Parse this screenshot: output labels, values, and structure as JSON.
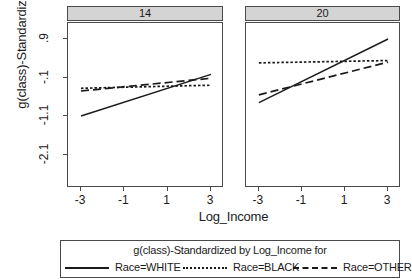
{
  "axes": {
    "ylabel": "g(class)-Standardized",
    "xlabel": "Log_Income",
    "yticks": [
      ".9",
      "-.1",
      "-1.1",
      "-2.1"
    ],
    "ytick_values": [
      0.9,
      -0.1,
      -1.1,
      -2.1
    ],
    "xticks": [
      "-3",
      "-1",
      "1",
      "3"
    ],
    "xtick_values": [
      -3,
      -1,
      1,
      3
    ]
  },
  "panels": [
    {
      "header": "14"
    },
    {
      "header": "20"
    }
  ],
  "legend": {
    "title": "g(class)-Standardized by Log_Income for",
    "entries": [
      {
        "label": "Race=WHITE",
        "style": "solid"
      },
      {
        "label": "Race=BLACK",
        "style": "dotted"
      },
      {
        "label": "Race=OTHER",
        "style": "dashed"
      }
    ]
  },
  "colors": {
    "line": "#1a1a1a",
    "frame": "#4a4a4a",
    "header_bg": "#d4d4d4",
    "background": "#ffffff"
  },
  "chart_data": {
    "type": "line",
    "title": "g(class)-Standardized by Log_Income for",
    "xlabel": "Log_Income",
    "ylabel": "g(class)-Standardized",
    "xlim": [
      -3.6,
      3.6
    ],
    "ylim": [
      -2.6,
      1.3
    ],
    "grid": false,
    "legend_position": "bottom",
    "panel_variable": "class",
    "panels": [
      {
        "name": "14",
        "series": [
          {
            "name": "Race=WHITE",
            "style": "solid",
            "x": [
              -3,
              3
            ],
            "y": [
              -1.1,
              -0.02
            ]
          },
          {
            "name": "Race=BLACK",
            "style": "dotted",
            "x": [
              -3,
              3
            ],
            "y": [
              -0.38,
              -0.3
            ]
          },
          {
            "name": "Race=OTHER",
            "style": "dashed",
            "x": [
              -3,
              3
            ],
            "y": [
              -0.45,
              -0.12
            ]
          }
        ]
      },
      {
        "name": "20",
        "series": [
          {
            "name": "Race=WHITE",
            "style": "solid",
            "x": [
              -3,
              3
            ],
            "y": [
              -0.75,
              0.9
            ]
          },
          {
            "name": "Race=BLACK",
            "style": "dotted",
            "x": [
              -3,
              3
            ],
            "y": [
              0.28,
              0.34
            ]
          },
          {
            "name": "Race=OTHER",
            "style": "dashed",
            "x": [
              -3,
              3
            ],
            "y": [
              -0.55,
              0.3
            ]
          }
        ]
      }
    ]
  },
  "geometry": {
    "panel1": {
      "left": 67,
      "right": 223,
      "top": 22,
      "bottom": 187
    },
    "panel2": {
      "left": 245,
      "right": 400,
      "top": 22,
      "bottom": 187
    },
    "header_top": 6,
    "y_pixels": {
      "0.9": 38,
      "-0.1": 76,
      "-1.1": 115,
      "-2.1": 153
    },
    "legend": {
      "left": 60,
      "top": 240,
      "width": 340,
      "height": 38
    }
  }
}
